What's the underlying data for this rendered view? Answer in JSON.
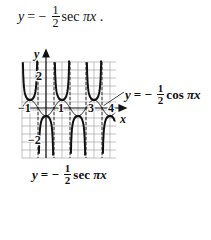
{
  "top_equation": {
    "lhs": "y",
    "eq": "= −",
    "num": "1",
    "den": "2",
    "func": "sec",
    "arg": "πx",
    "tail": "."
  },
  "graph_labels": {
    "y_axis": "y",
    "x_axis": "x",
    "ticks": {
      "x_neg1": "−1",
      "x_1": "1",
      "x_3": "3",
      "x_4": "4",
      "y_2": "2",
      "y_neg2": "−2"
    },
    "cos_label": {
      "lhs": "y",
      "eq": "= −",
      "num": "1",
      "den": "2",
      "func": "cos",
      "arg": "πx"
    },
    "sec_label": {
      "lhs": "y",
      "eq": "= −",
      "num": "1",
      "den": "2",
      "func": "sec",
      "arg": "πx"
    }
  },
  "chart_data": {
    "type": "line",
    "title": "",
    "xlabel": "x",
    "ylabel": "y",
    "xlim": [
      -1.5,
      4.3
    ],
    "ylim": [
      -3,
      3
    ],
    "grid": true,
    "series": [
      {
        "name": "y = -1/2 cos πx",
        "style": "thin",
        "x": [
          -1,
          -0.5,
          0,
          0.5,
          1,
          1.5,
          2,
          2.5,
          3,
          3.5,
          4
        ],
        "values": [
          0.5,
          0,
          -0.5,
          0,
          0.5,
          0,
          -0.5,
          0,
          0.5,
          0,
          -0.5
        ]
      },
      {
        "name": "y = -1/2 sec πx",
        "style": "bold",
        "asymptotes": [
          -0.5,
          0.5,
          1.5,
          2.5,
          3.5
        ],
        "local_extrema": [
          [
            0,
            -0.5
          ],
          [
            1,
            0.5
          ],
          [
            2,
            -0.5
          ],
          [
            3,
            0.5
          ],
          [
            4,
            -0.5
          ]
        ]
      }
    ]
  }
}
